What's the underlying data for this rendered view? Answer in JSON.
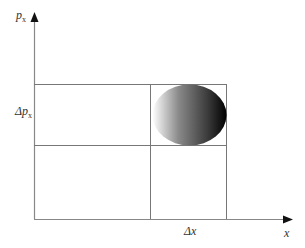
{
  "diagram": {
    "y_axis_label": "p",
    "y_axis_sub": "x",
    "x_axis_label": "x",
    "delta_p_label": "Δp",
    "delta_p_sub": "x",
    "delta_x_label": "Δx",
    "colors": {
      "line": "#777777",
      "axis": "#888888",
      "arrow": "#111111",
      "blob_light": "#ffffff",
      "blob_dark": "#000000"
    }
  }
}
